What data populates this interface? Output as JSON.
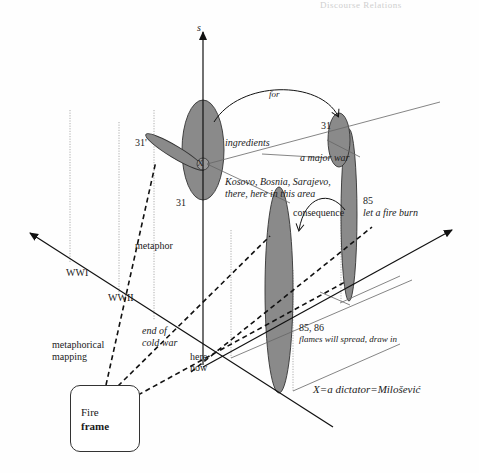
{
  "page": {
    "running_header": "Discourse Relations"
  },
  "diagram": {
    "axis_labels": {
      "vertical": "s"
    },
    "frame_box": {
      "line1": "Fire",
      "line2": "frame"
    },
    "labels": {
      "for": "for",
      "ingredients": "ingredients",
      "a_major_war": "a major war",
      "places_line1": "Kosovo, Bosnia, Sarajevo,",
      "places_line2": "there, here in this area",
      "consequence": "consequence",
      "x_marker": "X",
      "ref_31_prime": "31'",
      "ref_31_left": "31",
      "ref_31_right": "31",
      "ref_85": "85",
      "let_a_fire_burn": "let a fire burn",
      "ref_85_86": "85, 86",
      "flames_will_spread": "flames will spread, draw in",
      "metaphor": "metaphor",
      "wwi": "WWI",
      "wwii": "WWII",
      "end_of_cold_war_1": "end of",
      "end_of_cold_war_2": "cold war",
      "here": "here",
      "now": "now",
      "metaphorical_mapping_1": "metaphorical",
      "metaphorical_mapping_2": "mapping",
      "x_definition": "X=a dictator=Milošević"
    },
    "colors": {
      "ellipse_fill": "#8a8a8a",
      "line": "#1a1a1a",
      "thin_line": "#888888",
      "dotted": "#999999"
    }
  }
}
